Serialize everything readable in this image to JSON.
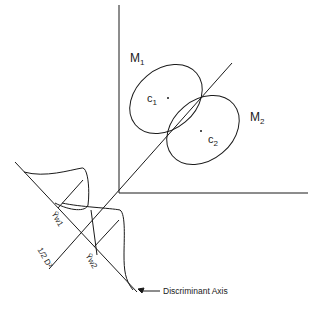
{
  "diagram": {
    "labels": {
      "m1": "M",
      "m1_sub": "1",
      "m2": "M",
      "m2_sub": "2",
      "c1": "c",
      "c1_sub": "1",
      "c2": "c",
      "c2_sub": "2",
      "yw1": "Ȳw1",
      "yw2": "Ȳw2",
      "half_d2": "1/2 D²",
      "discriminant_axis": "Discriminant Axis"
    },
    "colors": {
      "line": "#1a1a1a",
      "background": "#ffffff"
    }
  }
}
